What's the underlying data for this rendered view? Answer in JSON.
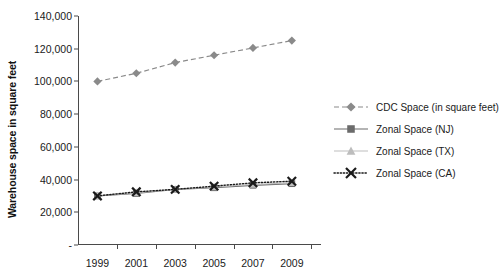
{
  "chart_data": {
    "type": "line",
    "title": "",
    "xlabel": "",
    "ylabel": "Warehouse space in square feet",
    "x": [
      1999,
      2000,
      2001,
      2002,
      2003,
      2004,
      2005,
      2006,
      2007,
      2008,
      2009
    ],
    "categories": [
      "1999",
      "2001",
      "2003",
      "2005",
      "2007",
      "2009"
    ],
    "x_tick_labels": [
      "1999",
      "2001",
      "2003",
      "2005",
      "2007",
      "2009"
    ],
    "x_tick_values": [
      1999,
      2001,
      2003,
      2005,
      2007,
      2009
    ],
    "x_minor_ticks": [
      2000,
      2002,
      2004,
      2006,
      2008,
      2010
    ],
    "xlim": [
      1998,
      2010.5
    ],
    "ylim": [
      0,
      140000
    ],
    "y_tick_labels": [
      "-",
      "20,000",
      "40,000",
      "60,000",
      "80,000",
      "100,000",
      "120,000",
      "140,000"
    ],
    "y_tick_values": [
      0,
      20000,
      40000,
      60000,
      80000,
      100000,
      120000,
      140000
    ],
    "grid": false,
    "legend_position": "right",
    "series": [
      {
        "name": "CDC Space (in square feet)",
        "marker": "diamond",
        "line_style": "dashed",
        "color": "#8a8a8a",
        "x": [
          1999,
          2001,
          2003,
          2005,
          2007,
          2009
        ],
        "values": [
          100000,
          105000,
          111500,
          116000,
          120500,
          125000
        ]
      },
      {
        "name": "Zonal Space (NJ)",
        "marker": "square",
        "line_style": "solid",
        "color": "#6b6b6b",
        "x": [
          1999,
          2001,
          2003,
          2005,
          2007,
          2009
        ],
        "values": [
          30000,
          31500,
          34000,
          35000,
          36500,
          37500
        ]
      },
      {
        "name": "Zonal Space (TX)",
        "marker": "triangle",
        "line_style": "solid",
        "color": "#bdbdbd",
        "x": [
          1999,
          2001,
          2003,
          2005,
          2007,
          2009
        ],
        "values": [
          30000,
          32000,
          34000,
          35500,
          37000,
          38000
        ]
      },
      {
        "name": "Zonal Space (CA)",
        "marker": "x",
        "line_style": "dotted",
        "color": "#1a1a1a",
        "x": [
          1999,
          2001,
          2003,
          2005,
          2007,
          2009
        ],
        "values": [
          30000,
          32500,
          34000,
          36000,
          38000,
          39000
        ]
      }
    ]
  },
  "legend": {
    "items": [
      {
        "label": "CDC Space (in square feet)"
      },
      {
        "label": "Zonal Space (NJ)"
      },
      {
        "label": "Zonal Space (TX)"
      },
      {
        "label": "Zonal Space (CA)"
      }
    ]
  }
}
